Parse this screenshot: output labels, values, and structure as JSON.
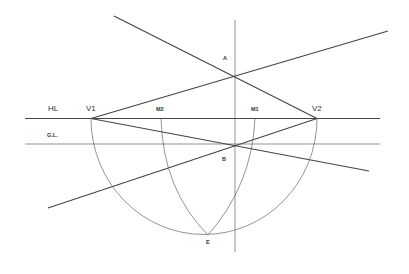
{
  "diagram": {
    "labels": {
      "horizon_line": "HL",
      "ground_line": "G.L.",
      "vanishing_point_left": "V1",
      "vanishing_point_right": "V2",
      "measuring_point_2": "M2",
      "measuring_point_1": "M1",
      "point_a": "A",
      "point_b": "B",
      "point_e": "E"
    },
    "colors": {
      "line": "#444444",
      "construction": "#666666",
      "background": "#ffffff"
    }
  }
}
